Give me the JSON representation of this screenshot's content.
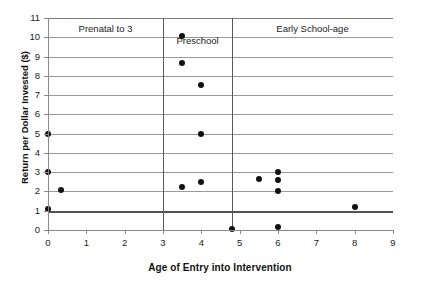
{
  "chart_data": {
    "type": "scatter",
    "title": "",
    "xlabel": "Age of Entry into Intervention",
    "ylabel": "Return per Dollar Invested ($)",
    "xlim": [
      0,
      9
    ],
    "ylim": [
      0,
      11
    ],
    "xticks": [
      0,
      1,
      2,
      3,
      4,
      5,
      6,
      7,
      8,
      9
    ],
    "yticks": [
      0,
      1,
      2,
      3,
      4,
      5,
      6,
      7,
      8,
      9,
      10,
      11
    ],
    "grid": "horizontal",
    "legend": "none",
    "points": [
      {
        "x": 0,
        "y": 5.0
      },
      {
        "x": 0,
        "y": 3.0
      },
      {
        "x": 0,
        "y": 1.1
      },
      {
        "x": 0.33,
        "y": 2.05
      },
      {
        "x": 3.5,
        "y": 10.05
      },
      {
        "x": 3.5,
        "y": 8.65
      },
      {
        "x": 3.5,
        "y": 2.25
      },
      {
        "x": 4.0,
        "y": 7.5
      },
      {
        "x": 4.0,
        "y": 5.0
      },
      {
        "x": 4.0,
        "y": 2.5
      },
      {
        "x": 4.8,
        "y": 0.05
      },
      {
        "x": 5.5,
        "y": 2.65
      },
      {
        "x": 6.0,
        "y": 3.0
      },
      {
        "x": 6.0,
        "y": 2.6
      },
      {
        "x": 6.0,
        "y": 2.0
      },
      {
        "x": 6.0,
        "y": 0.15
      },
      {
        "x": 8.0,
        "y": 1.2
      }
    ],
    "reference_lines": [
      {
        "orientation": "horizontal",
        "value": 1,
        "style": "thick"
      }
    ],
    "region_dividers": [
      3.0,
      4.8
    ],
    "regions": [
      {
        "label": "Prenatal to 3",
        "x_start": 0.0,
        "x_end": 3.0
      },
      {
        "label": "Preschool",
        "x_start": 3.0,
        "x_end": 4.8
      },
      {
        "label": "Early School-age",
        "x_start": 4.8,
        "x_end": 9.0
      }
    ],
    "colors": {
      "marker": "#111111",
      "grid": "#9a9a9a",
      "axis": "#8a8a8a",
      "divider": "#5a5a5a",
      "reference_line": "#555555",
      "background": "#ffffff"
    }
  }
}
